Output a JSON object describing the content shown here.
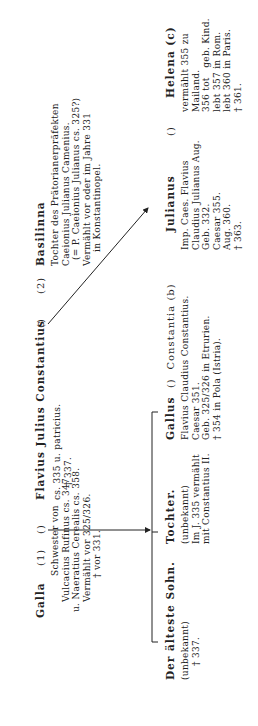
{
  "parents": {
    "galla": {
      "name": "Galla",
      "marker": "(1)",
      "lines": [
        "Schwester von",
        "Vulcacius Rufinus cs. 347",
        "u. Naeratius Cerealis cs. 358.",
        "Vermählt vor 325/326.",
        "† vor 331."
      ]
    },
    "marriage1_symbol": "()",
    "constantius": {
      "name": "Flavius Julius Constantius",
      "lines": [
        "cs. 335 u. patricius.",
        "† 337."
      ]
    },
    "marriage2_symbol": "()",
    "marker2": "(2)",
    "basilinna": {
      "name": "Basilinna",
      "lines": [
        "Tochter des Prätorianerpräfekten",
        "Caeionius Julianus Camenius.",
        "(= P. Caeionius Julianus cs. 325?)",
        "Vermählt vor oder im Jahre 331",
        "in Konstantinopel."
      ]
    }
  },
  "children": {
    "eldest_son": {
      "name": "Der älteste Sohn.",
      "lines": [
        "(unbekannt)",
        "† 337."
      ]
    },
    "daughter": {
      "name": "Tochter.",
      "lines": [
        "(unbekannt)",
        "Im J. 335 vermählt",
        "mit Constantius II."
      ]
    },
    "gallus": {
      "name": "Gallus",
      "symbol": "()",
      "spouse": "Constantia (b)",
      "lines": [
        "Flavius Claudius Constantius.",
        "Caesar 351.",
        "Geb. 325/326 in Etrurien.",
        "† 354 in Pola (Istria)."
      ]
    },
    "julianus": {
      "name": "Julianus",
      "symbol": "()",
      "lines": [
        "Imp. Caes. Flavius",
        "Claudius Julianus Aug.",
        "Geb. 332.",
        "Caesar 355.",
        "Aug. 360.",
        "† 363."
      ]
    },
    "helena": {
      "name": "Helena (c)",
      "lines": [
        "vermählt 355 zu",
        "Mailand.",
        "356 tot   geb. Kind.",
        "lebt 357 in Rom.",
        "lebt 360 in Paris.",
        "† 361."
      ]
    }
  }
}
